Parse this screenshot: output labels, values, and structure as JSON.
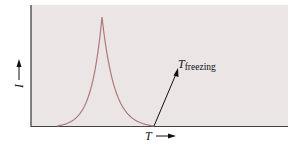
{
  "chart_data": {
    "type": "line",
    "title": "",
    "xlabel": "T",
    "ylabel": "I",
    "x_arrow": "right",
    "y_arrow": "up",
    "grid": false,
    "background_color": "#ebe5e6",
    "curve_color": "#b07878",
    "annotation": {
      "main": "T",
      "subscript": "freezing",
      "points_to": "curve minimum on x-axis (right end of peak)"
    },
    "series": [
      {
        "name": "I(T)",
        "x": [
          0.0,
          0.05,
          0.1,
          0.15,
          0.2,
          0.25,
          0.28,
          0.3,
          0.32,
          0.35,
          0.4,
          0.45,
          0.5,
          0.55,
          0.6
        ],
        "y": [
          0.0,
          0.01,
          0.03,
          0.08,
          0.2,
          0.5,
          0.8,
          1.0,
          0.8,
          0.5,
          0.22,
          0.09,
          0.03,
          0.01,
          0.0
        ]
      }
    ],
    "xlim": [
      -0.15,
      1.5
    ],
    "ylim": [
      0,
      1.1
    ]
  }
}
